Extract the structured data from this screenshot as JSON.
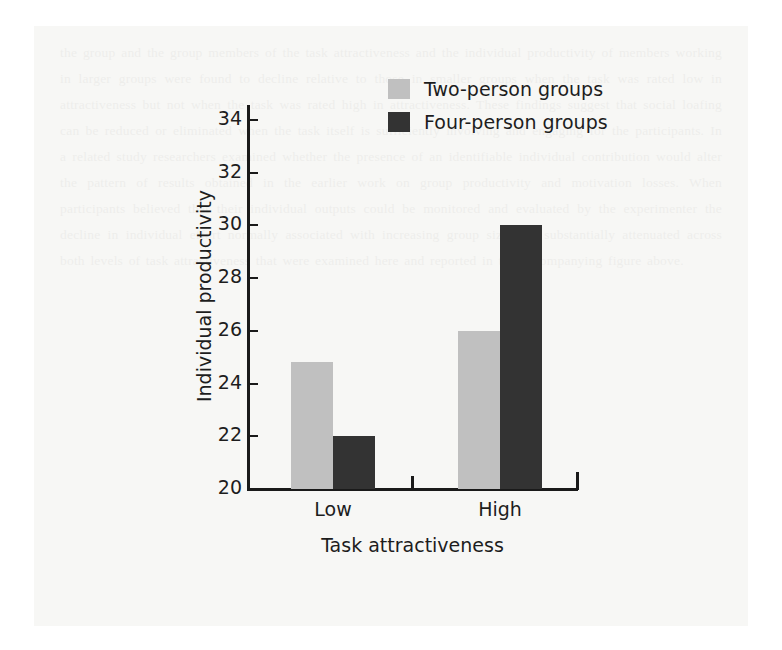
{
  "chart_data": {
    "type": "bar",
    "title": "",
    "xlabel": "Task attractiveness",
    "ylabel": "Individual productivity",
    "categories": [
      "Low",
      "High"
    ],
    "series": [
      {
        "name": "Two-person groups",
        "values": [
          24.8,
          26
        ],
        "color": "#c0c0c0"
      },
      {
        "name": "Four-person groups",
        "values": [
          22,
          30
        ],
        "color": "#333333"
      }
    ],
    "ylim": [
      20,
      34
    ],
    "yticks": [
      20,
      22,
      24,
      26,
      28,
      30,
      32,
      34
    ],
    "ytick_labels": [
      "20",
      "22",
      "24",
      "26",
      "28",
      "30",
      "32",
      "34"
    ],
    "grid": false,
    "legend_position": "top-right"
  },
  "legend": {
    "items": [
      {
        "label": "Two-person groups",
        "color": "#c0c0c0"
      },
      {
        "label": "Four-person groups",
        "color": "#333333"
      }
    ]
  },
  "page": {
    "ghost_text": "the group and the group members of the task attractiveness and the individual productivity of members working in larger groups were found to decline relative to those in smaller groups when the task was rated low in attractiveness but not when the task was rated high in attractiveness. These findings suggest that social loafing can be reduced or eliminated when the task itself is sufficiently involving and engaging for the participants. In a related study researchers examined whether the presence of an identifiable individual contribution would alter the pattern of results obtained in the earlier work on group productivity and motivation losses. When participants believed that their individual outputs could be monitored and evaluated by the experimenter the decline in individual effort normally associated with increasing group size was substantially attenuated across both levels of task attractiveness that were examined here and reported in the accompanying figure above."
  }
}
